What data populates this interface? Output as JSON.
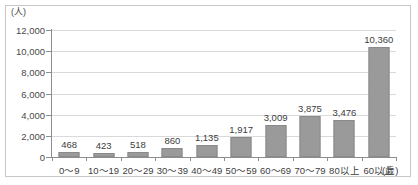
{
  "chart_data": {
    "type": "bar",
    "title": "",
    "xlabel": "(歳)",
    "ylabel": "(人)",
    "ylim": [
      0,
      12000
    ],
    "ytick_values": [
      0,
      2000,
      4000,
      6000,
      8000,
      10000,
      12000
    ],
    "ytick_labels": [
      "0",
      "2,000",
      "4,000",
      "6,000",
      "8,000",
      "10,000",
      "12,000"
    ],
    "grid": true,
    "legend": null,
    "categories": [
      "0～9",
      "10～19",
      "20～29",
      "30～39",
      "40～49",
      "50～59",
      "60～69",
      "70～79",
      "80以上",
      "60以上"
    ],
    "values": [
      468,
      423,
      518,
      860,
      1135,
      1917,
      3009,
      3875,
      3476,
      10360
    ],
    "value_labels": [
      "468",
      "423",
      "518",
      "860",
      "1,135",
      "1,917",
      "3,009",
      "3,875",
      "3,476",
      "10,360"
    ],
    "bar_color": "#9a9a9a",
    "bar_border_color": "#8a8a8a",
    "gridline_color": "#d9d9d9",
    "axis_color": "#8d8d8d",
    "frame_border_color": "#c8c8c8",
    "background_color": "#ffffff"
  }
}
